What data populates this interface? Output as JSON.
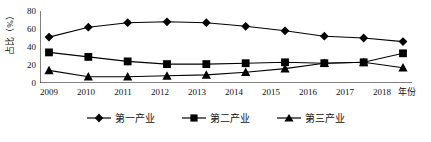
{
  "chart_data": {
    "type": "line",
    "title": "",
    "xlabel": "年份",
    "ylabel": "占比（%）",
    "categories": [
      "2009",
      "2010",
      "2011",
      "2012",
      "2013",
      "2014",
      "2015",
      "2016",
      "2017",
      "2018"
    ],
    "ylim": [
      0,
      80
    ],
    "yticks": [
      0,
      20,
      40,
      60,
      80
    ],
    "grid": false,
    "legend_position": "bottom-center",
    "series": [
      {
        "name": "第一产业",
        "marker": "diamond",
        "color": "#000000",
        "values": [
          51,
          62,
          67,
          68,
          67,
          63,
          58,
          52,
          50,
          46
        ]
      },
      {
        "name": "第二产业",
        "marker": "square",
        "color": "#000000",
        "values": [
          34,
          29,
          24,
          21,
          21,
          22,
          23,
          22,
          23,
          33
        ]
      },
      {
        "name": "第三产业",
        "marker": "triangle",
        "color": "#000000",
        "values": [
          14,
          7,
          7,
          8,
          9,
          12,
          16,
          22,
          23,
          17
        ]
      }
    ]
  },
  "axis": {
    "y_title": "占比（%）",
    "x_title": "年份",
    "y_tick_labels": [
      "80",
      "60",
      "40",
      "20",
      "0"
    ],
    "x_tick_labels": [
      "2009",
      "2010",
      "2011",
      "2012",
      "2013",
      "2014",
      "2015",
      "2016",
      "2017",
      "2018"
    ]
  },
  "legend": {
    "items": [
      {
        "label": "第一产业",
        "marker": "diamond-marker-icon"
      },
      {
        "label": "第二产业",
        "marker": "square-marker-icon"
      },
      {
        "label": "第三产业",
        "marker": "triangle-marker-icon"
      }
    ]
  }
}
